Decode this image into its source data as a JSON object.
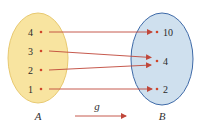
{
  "diagram": {
    "type": "function-mapping",
    "function_name": "g",
    "set_a": {
      "label": "A",
      "fill": "#f8e4a0",
      "stroke": "#e8c970",
      "elements": [
        "4",
        "3",
        "2",
        "1"
      ]
    },
    "set_b": {
      "label": "B",
      "fill": "#cfe0ee",
      "stroke": "#3e6aa8",
      "elements": [
        "10",
        "4",
        "2"
      ]
    },
    "mappings": [
      {
        "from": "4",
        "to": "10"
      },
      {
        "from": "3",
        "to": "4"
      },
      {
        "from": "2",
        "to": "4"
      },
      {
        "from": "1",
        "to": "2"
      }
    ],
    "arrow_color": "#c0473a",
    "dot_color": "#d0452a"
  }
}
